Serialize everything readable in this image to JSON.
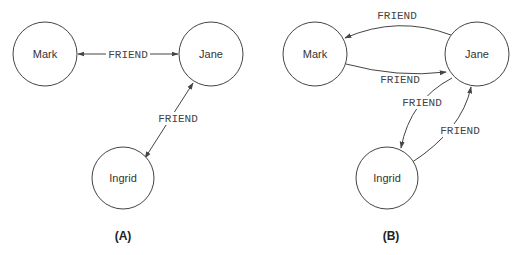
{
  "diagrams": [
    {
      "caption": "(A)",
      "nodes": [
        {
          "id": "mark",
          "label": "Mark"
        },
        {
          "id": "jane",
          "label": "Jane"
        },
        {
          "id": "ingrid",
          "label": "Ingrid"
        }
      ],
      "edges": [
        {
          "from": "mark",
          "to": "jane",
          "label": "FRIEND",
          "direction": "bidirectional"
        },
        {
          "from": "jane",
          "to": "ingrid",
          "label": "FRIEND",
          "direction": "bidirectional"
        }
      ]
    },
    {
      "caption": "(B)",
      "nodes": [
        {
          "id": "mark",
          "label": "Mark"
        },
        {
          "id": "jane",
          "label": "Jane"
        },
        {
          "id": "ingrid",
          "label": "Ingrid"
        }
      ],
      "edges": [
        {
          "from": "jane",
          "to": "mark",
          "label": "FRIEND",
          "direction": "directed"
        },
        {
          "from": "mark",
          "to": "jane",
          "label": "FRIEND",
          "direction": "directed"
        },
        {
          "from": "jane",
          "to": "ingrid",
          "label": "FRIEND",
          "direction": "directed"
        },
        {
          "from": "ingrid",
          "to": "jane",
          "label": "FRIEND",
          "direction": "directed"
        }
      ]
    }
  ],
  "colors": {
    "stroke": "#444444",
    "background": "#ffffff"
  }
}
